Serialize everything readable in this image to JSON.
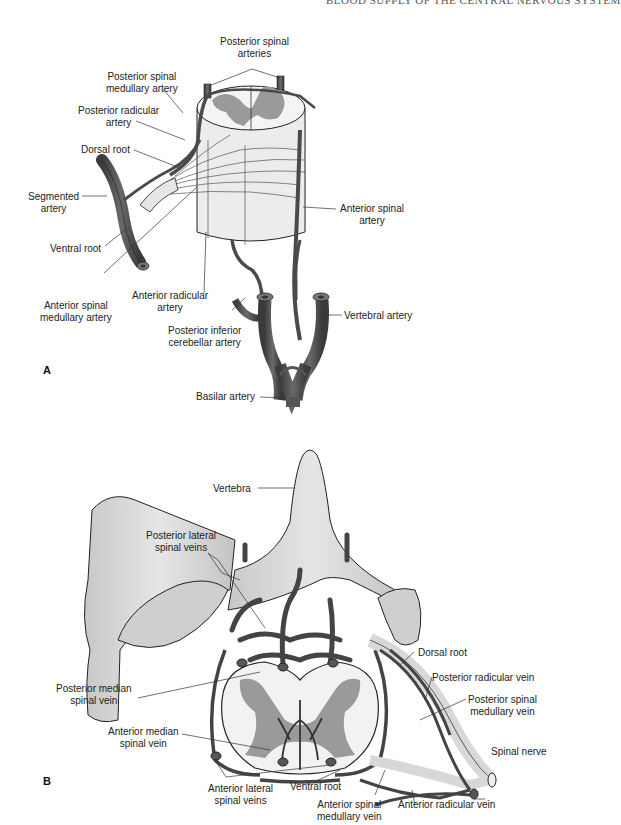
{
  "header": {
    "running_title": "BLOOD SUPPLY OF THE CENTRAL NERVOUS SYSTEM"
  },
  "panel_a": {
    "letter": "A",
    "labels": {
      "posterior_spinal_arteries": "Posterior spinal\narteries",
      "posterior_spinal_medullary_artery": "Posterior spinal\nmedullary artery",
      "posterior_radicular_artery": "Posterior radicular\nartery",
      "dorsal_root": "Dorsal root",
      "segmented_artery": "Segmented\nartery",
      "ventral_root": "Ventral root",
      "anterior_spinal_artery": "Anterior spinal\nartery",
      "anterior_spinal_medullary_artery": "Anterior spinal\nmedullary artery",
      "anterior_radicular_artery": "Anterior radicular\nartery",
      "posterior_inferior_cerebellar_artery": "Posterior inferior\ncerebellar artery",
      "vertebral_artery": "Vertebral artery",
      "basilar_artery": "Basilar artery"
    }
  },
  "panel_b": {
    "letter": "B",
    "labels": {
      "vertebra": "Vertebra",
      "posterior_lateral_spinal_veins": "Posterior lateral\nspinal veins",
      "dorsal_root": "Dorsal root",
      "posterior_radicular_vein": "Posterior radicular vein",
      "posterior_spinal_medullary_vein": "Posterior spinal\nmedullary vein",
      "posterior_median_spinal_vein": "Posterior median\nspinal vein",
      "anterior_median_spinal_vein": "Anterior median\nspinal vein",
      "spinal_nerve": "Spinal nerve",
      "anterior_lateral_spinal_veins": "Anterior lateral\nspinal veins",
      "ventral_root": "Ventral root",
      "anterior_spinal_medullary_vein": "Anterior spinal\nmedullary vein",
      "anterior_radicular_vein": "Anterior radicular vein"
    }
  },
  "colors": {
    "vessel": "#4a4a4a",
    "vessel_highlight": "#6b6b6b",
    "gray_matter": "#9a9a9a",
    "tissue": "#eeeeee",
    "bone": "#d6d6d6",
    "leader_line": "#333333"
  }
}
